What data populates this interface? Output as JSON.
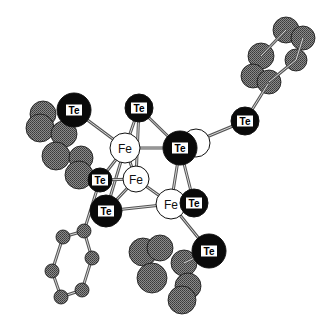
{
  "diagram": {
    "type": "ball-and-stick molecular structure",
    "colors": {
      "te_fill": "#0a0a0a",
      "te_label_bg": "#ffffff",
      "fe_fill": "#ffffff",
      "carbon_fill": "#6e6e6e",
      "bond": "#555555",
      "outline": "#111111"
    },
    "labels": {
      "te": "Te",
      "fe": "Fe"
    },
    "carbons_back": [
      {
        "x": 286,
        "y": 30,
        "r": 13
      },
      {
        "x": 303,
        "y": 38,
        "r": 12
      },
      {
        "x": 261,
        "y": 56,
        "r": 13
      },
      {
        "x": 296,
        "y": 60,
        "r": 11
      },
      {
        "x": 253,
        "y": 76,
        "r": 12
      },
      {
        "x": 269,
        "y": 82,
        "r": 12
      },
      {
        "x": 43,
        "y": 114,
        "r": 13
      },
      {
        "x": 40,
        "y": 128,
        "r": 14
      },
      {
        "x": 64,
        "y": 134,
        "r": 13
      },
      {
        "x": 56,
        "y": 156,
        "r": 14
      },
      {
        "x": 81,
        "y": 158,
        "r": 12
      },
      {
        "x": 79,
        "y": 175,
        "r": 14
      },
      {
        "x": 143,
        "y": 252,
        "r": 14
      },
      {
        "x": 160,
        "y": 248,
        "r": 13
      },
      {
        "x": 184,
        "y": 263,
        "r": 13
      },
      {
        "x": 152,
        "y": 278,
        "r": 15
      },
      {
        "x": 188,
        "y": 286,
        "r": 13
      },
      {
        "x": 182,
        "y": 300,
        "r": 14
      }
    ],
    "ring_bottom_left": [
      {
        "x": 84,
        "y": 231,
        "r": 7
      },
      {
        "x": 63,
        "y": 237,
        "r": 7
      },
      {
        "x": 92,
        "y": 258,
        "r": 7
      },
      {
        "x": 52,
        "y": 271,
        "r": 7
      },
      {
        "x": 82,
        "y": 290,
        "r": 7
      },
      {
        "x": 61,
        "y": 297,
        "r": 7
      }
    ],
    "bonds": [
      {
        "x1": 74,
        "y1": 110,
        "x2": 125,
        "y2": 148
      },
      {
        "x1": 139,
        "y1": 108,
        "x2": 125,
        "y2": 148
      },
      {
        "x1": 139,
        "y1": 108,
        "x2": 136,
        "y2": 179
      },
      {
        "x1": 139,
        "y1": 108,
        "x2": 180,
        "y2": 148
      },
      {
        "x1": 125,
        "y1": 148,
        "x2": 180,
        "y2": 148
      },
      {
        "x1": 125,
        "y1": 148,
        "x2": 136,
        "y2": 179
      },
      {
        "x1": 125,
        "y1": 148,
        "x2": 106,
        "y2": 211
      },
      {
        "x1": 125,
        "y1": 148,
        "x2": 100,
        "y2": 180
      },
      {
        "x1": 136,
        "y1": 179,
        "x2": 171,
        "y2": 204
      },
      {
        "x1": 136,
        "y1": 179,
        "x2": 106,
        "y2": 211
      },
      {
        "x1": 136,
        "y1": 179,
        "x2": 100,
        "y2": 180
      },
      {
        "x1": 106,
        "y1": 211,
        "x2": 171,
        "y2": 204
      },
      {
        "x1": 180,
        "y1": 148,
        "x2": 171,
        "y2": 204
      },
      {
        "x1": 180,
        "y1": 148,
        "x2": 194,
        "y2": 203
      },
      {
        "x1": 180,
        "y1": 148,
        "x2": 245,
        "y2": 121
      },
      {
        "x1": 171,
        "y1": 204,
        "x2": 209,
        "y2": 251
      },
      {
        "x1": 245,
        "y1": 121,
        "x2": 268,
        "y2": 84
      },
      {
        "x1": 100,
        "y1": 180,
        "x2": 84,
        "y2": 231
      },
      {
        "x1": 84,
        "y1": 231,
        "x2": 63,
        "y2": 237
      },
      {
        "x1": 84,
        "y1": 231,
        "x2": 92,
        "y2": 258
      },
      {
        "x1": 92,
        "y1": 258,
        "x2": 82,
        "y2": 290
      },
      {
        "x1": 63,
        "y1": 237,
        "x2": 52,
        "y2": 271
      },
      {
        "x1": 52,
        "y1": 271,
        "x2": 61,
        "y2": 297
      },
      {
        "x1": 61,
        "y1": 297,
        "x2": 82,
        "y2": 290
      },
      {
        "x1": 209,
        "y1": 251,
        "x2": 184,
        "y2": 263
      },
      {
        "x1": 261,
        "y1": 56,
        "x2": 286,
        "y2": 30
      },
      {
        "x1": 296,
        "y1": 60,
        "x2": 269,
        "y2": 82
      },
      {
        "x1": 303,
        "y1": 38,
        "x2": 296,
        "y2": 60
      }
    ],
    "ghost_atom": {
      "x": 196,
      "y": 143,
      "r": 14
    },
    "tellurium_atoms": [
      {
        "x": 74,
        "y": 110,
        "r": 17
      },
      {
        "x": 139,
        "y": 108,
        "r": 14
      },
      {
        "x": 245,
        "y": 121,
        "r": 14
      },
      {
        "x": 100,
        "y": 180,
        "r": 12
      },
      {
        "x": 106,
        "y": 211,
        "r": 16
      },
      {
        "x": 180,
        "y": 148,
        "r": 17
      },
      {
        "x": 194,
        "y": 203,
        "r": 14
      },
      {
        "x": 209,
        "y": 251,
        "r": 17
      }
    ],
    "iron_atoms": [
      {
        "x": 125,
        "y": 148,
        "r": 15
      },
      {
        "x": 136,
        "y": 179,
        "r": 13
      },
      {
        "x": 171,
        "y": 204,
        "r": 15
      }
    ]
  }
}
